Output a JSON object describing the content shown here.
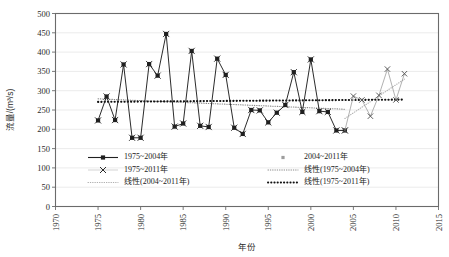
{
  "chart_data": {
    "type": "line",
    "title": "",
    "xlabel": "年份",
    "ylabel": "流量/(m³/s)",
    "xlim": [
      1970,
      2015
    ],
    "ylim": [
      0,
      500
    ],
    "xticks": [
      1970,
      1975,
      1980,
      1985,
      1990,
      1995,
      2000,
      2005,
      2010,
      2015
    ],
    "yticks": [
      0,
      50,
      100,
      150,
      200,
      250,
      300,
      350,
      400,
      450,
      500
    ],
    "grid": "horizontal",
    "legend_position": "inside-lower-center",
    "series": [
      {
        "name": "1975~2004年",
        "marker": "square-with-x",
        "color": "#202020",
        "style": "solid",
        "x": [
          1975,
          1976,
          1977,
          1978,
          1979,
          1980,
          1981,
          1982,
          1983,
          1984,
          1985,
          1986,
          1987,
          1988,
          1989,
          1990,
          1991,
          1992,
          1993,
          1994,
          1995,
          1996,
          1997,
          1998,
          1999,
          2000,
          2001,
          2002,
          2003,
          2004
        ],
        "values": [
          223,
          285,
          224,
          368,
          178,
          178,
          369,
          339,
          447,
          207,
          215,
          403,
          209,
          206,
          383,
          341,
          204,
          188,
          250,
          249,
          218,
          243,
          263,
          348,
          245,
          381,
          247,
          245,
          197,
          197
        ]
      },
      {
        "name": "2004~2011年",
        "marker": "x",
        "color": "#9d9d9d",
        "style": "solid",
        "x": [
          2004,
          2005,
          2006,
          2007,
          2008,
          2009,
          2010,
          2011
        ],
        "values": [
          197,
          286,
          276,
          234,
          288,
          356,
          276,
          344
        ]
      }
    ],
    "trendlines": [
      {
        "name": "线性(1975~2004年)",
        "color": "#8a8a8a",
        "style": "dotted",
        "x": [
          1975,
          2004
        ],
        "values": [
          279,
          252
        ]
      },
      {
        "name": "线性(2004~2011年)",
        "color": "#b0b0b0",
        "style": "dotted",
        "x": [
          2004,
          2011
        ],
        "values": [
          228,
          330
        ]
      },
      {
        "name": "线性(1975~2011年)",
        "color": "#111111",
        "style": "bold-dotted",
        "x": [
          1975,
          2011
        ],
        "values": [
          271,
          277
        ]
      }
    ],
    "legend": [
      {
        "label": "1975~2004年",
        "glyph": "line-square-marker",
        "color": "#202020"
      },
      {
        "label": "2004~2011年",
        "glyph": "point-marker",
        "color": "#9d9d9d"
      },
      {
        "label": "1975~2011年",
        "glyph": "line-x-marker",
        "color": "#6d6d6d"
      },
      {
        "label": "线性(1975~2004年)",
        "glyph": "dotted-line",
        "color": "#8a8a8a"
      },
      {
        "label": "线性(2004~2011年)",
        "glyph": "dotted-line",
        "color": "#b0b0b0"
      },
      {
        "label": "线性(1975~2011年)",
        "glyph": "bold-dotted-line",
        "color": "#111111"
      }
    ]
  }
}
